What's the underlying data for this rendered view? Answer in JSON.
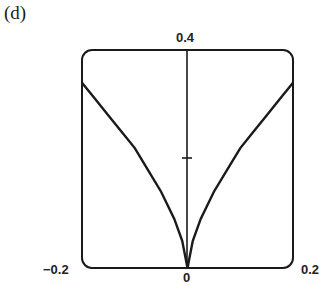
{
  "panel": {
    "label": "(d)"
  },
  "axes": {
    "x_min_label": "−0.2",
    "x_zero_label": "0",
    "x_max_label": "0.2",
    "y_top_label": "0.4"
  },
  "chart_data": {
    "type": "line",
    "title": "(d)",
    "xlabel": "",
    "ylabel": "",
    "xlim": [
      -0.2,
      0.2
    ],
    "ylim": [
      0,
      0.4
    ],
    "x_ticks": [
      -0.2,
      0,
      0.2
    ],
    "y_ticks": [
      0.2,
      0.4
    ],
    "tick_labels": {
      "x": [
        "−0.2",
        "0",
        "0.2"
      ],
      "y": [
        "0.4"
      ]
    },
    "grid": false,
    "legend": null,
    "annotations": [
      "cusp at origin"
    ],
    "series": [
      {
        "name": "cusp curve",
        "x": [
          -0.2,
          -0.175,
          -0.15,
          -0.125,
          -0.1,
          -0.075,
          -0.05,
          -0.025,
          -0.01,
          0,
          0.01,
          0.025,
          0.05,
          0.075,
          0.1,
          0.125,
          0.15,
          0.175,
          0.2
        ],
        "y": [
          0.34,
          0.31,
          0.28,
          0.25,
          0.22,
          0.18,
          0.14,
          0.09,
          0.05,
          0,
          0.05,
          0.09,
          0.14,
          0.18,
          0.22,
          0.25,
          0.28,
          0.31,
          0.34
        ]
      }
    ]
  },
  "colors": {
    "stroke": "#1a1a1a",
    "background": "#ffffff"
  }
}
